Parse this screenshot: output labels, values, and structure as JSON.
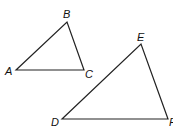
{
  "diagram": {
    "triangles": [
      {
        "name": "ABC",
        "vertices": [
          {
            "label": "A",
            "x": 16,
            "y": 70,
            "lx": 5,
            "ly": 75
          },
          {
            "label": "B",
            "x": 67,
            "y": 22,
            "lx": 63,
            "ly": 18
          },
          {
            "label": "C",
            "x": 84,
            "y": 70,
            "lx": 85,
            "ly": 78
          }
        ]
      },
      {
        "name": "DEF",
        "vertices": [
          {
            "label": "D",
            "x": 62,
            "y": 119,
            "lx": 51,
            "ly": 126
          },
          {
            "label": "E",
            "x": 141,
            "y": 44,
            "lx": 137,
            "ly": 41
          },
          {
            "label": "F",
            "x": 168,
            "y": 119,
            "lx": 169,
            "ly": 126
          }
        ]
      }
    ],
    "stroke_color": "#222222"
  }
}
